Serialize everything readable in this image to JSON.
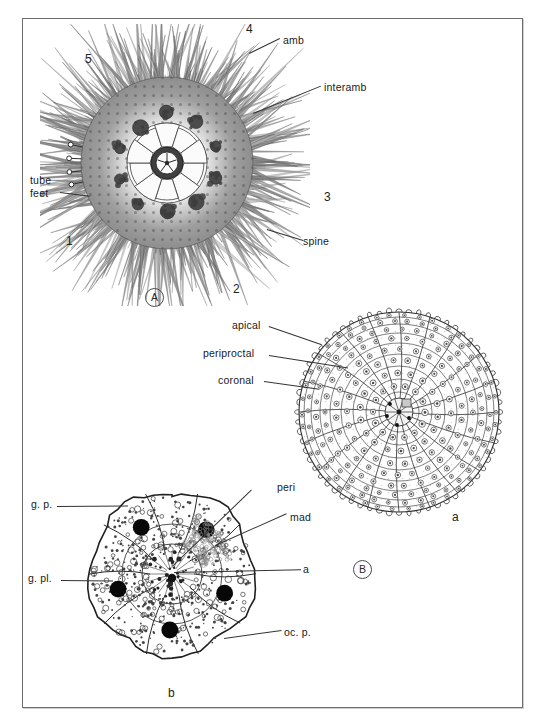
{
  "figure": {
    "background_color": "#ffffff",
    "ink_color": "#1a1a1a",
    "frame_color": "#6e6e6e"
  },
  "panels": [
    {
      "tag": "A",
      "caption": "A",
      "description": "Whole sea urchin in aboral view with spines and tube feet",
      "labels": [
        {
          "key": "amb",
          "text": "amb"
        },
        {
          "key": "interamb",
          "text": "interamb"
        },
        {
          "key": "spine",
          "text": "spine"
        },
        {
          "key": "tube_feet",
          "text": "tube\nfeet"
        },
        {
          "key": "tube_feet_line1",
          "text": "tube"
        },
        {
          "key": "tube_feet_line2",
          "text": "feet"
        }
      ],
      "ray_numbers": [
        "1",
        "2",
        "3",
        "4",
        "5"
      ]
    },
    {
      "tag": "B",
      "caption": "B",
      "description": "Denuded test (a) and apical system detail (b)",
      "subpanels": [
        {
          "tag": "a",
          "caption": "a",
          "description": "Denuded test showing plate architecture",
          "labels": [
            {
              "key": "apical",
              "text": "apical"
            },
            {
              "key": "periproctal",
              "text": "periproctal"
            },
            {
              "key": "coronal",
              "text": "coronal"
            }
          ]
        },
        {
          "tag": "b",
          "caption": "b",
          "description": "Apical system plates enlarged",
          "labels": [
            {
              "key": "gp",
              "text": "g. p."
            },
            {
              "key": "gpl",
              "text": "g. pl."
            },
            {
              "key": "peri",
              "text": "peri"
            },
            {
              "key": "mad",
              "text": "mad"
            },
            {
              "key": "a",
              "text": "a"
            },
            {
              "key": "ocp",
              "text": "oc. p."
            }
          ]
        }
      ]
    }
  ],
  "chart_data": {
    "type": "diagram",
    "panel_a": {
      "label": "A",
      "center": [
        167,
        163
      ],
      "radius": 118,
      "ray_number_positions": [
        {
          "label": "1",
          "x": 68,
          "y": 243
        },
        {
          "label": "2",
          "x": 236,
          "y": 291
        },
        {
          "label": "3",
          "x": 327,
          "y": 199
        },
        {
          "label": "4",
          "x": 249,
          "y": 31
        },
        {
          "label": "5",
          "x": 88,
          "y": 60
        }
      ]
    },
    "panel_b_a": {
      "label": "a",
      "center": [
        398,
        413
      ],
      "radius": 103,
      "ambulacral_columns": 10,
      "interambulacral_columns": 10
    },
    "panel_b_b": {
      "label": "b",
      "center": [
        170,
        570
      ],
      "radius": 85,
      "genital_plates": 5,
      "ocular_plates": 5
    }
  }
}
